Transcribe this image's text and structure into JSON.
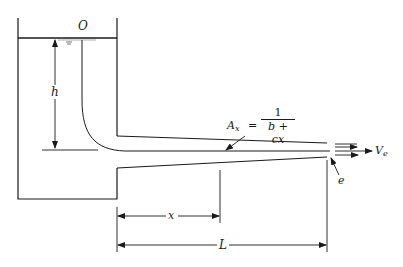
{
  "figure": {
    "type": "fluid-mechanics-schematic"
  },
  "labels": {
    "origin": "O",
    "head": "h",
    "area_lhs": "A",
    "area_lhs_sub": "x",
    "equals": "=",
    "area_num": "1",
    "area_den": "b + cx",
    "exit_point": "e",
    "velocity": "V",
    "velocity_sub": "e",
    "x_dim": "x",
    "length_dim": "L"
  },
  "colors": {
    "ink": "#1a1a1a",
    "background": "#ffffff"
  }
}
